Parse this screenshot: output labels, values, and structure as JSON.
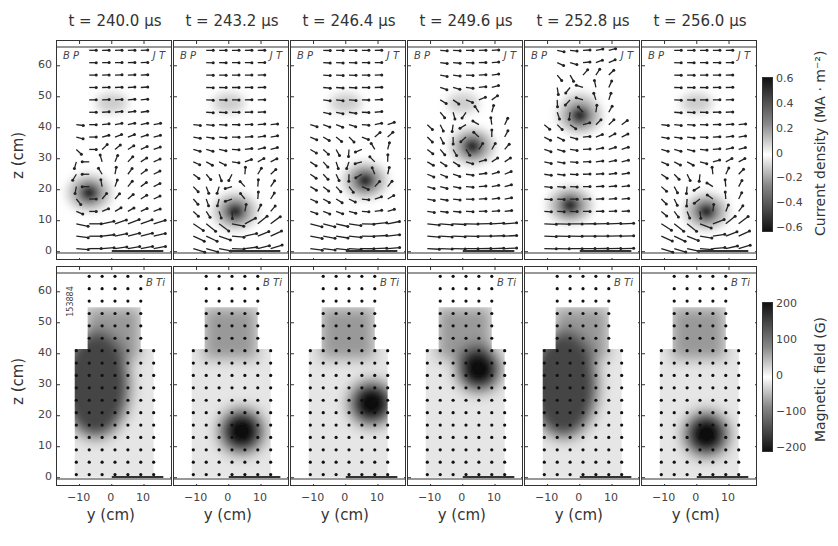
{
  "figure": {
    "shot_id": "153884",
    "times": [
      "t = 240.0 μs",
      "t = 243.2 μs",
      "t = 246.4 μs",
      "t = 249.6 μs",
      "t = 252.8 μs",
      "t = 256.0 μs"
    ],
    "top_row": {
      "left_label": "B P",
      "right_label": "J T",
      "ylabel": "z (cm)"
    },
    "bottom_row": {
      "right_label": "B Ti",
      "ylabel": "z (cm)",
      "xlabel": "y (cm)"
    },
    "yticks": [
      "60",
      "50",
      "40",
      "30",
      "20",
      "10",
      "0"
    ],
    "xticks": [
      "−10",
      "0",
      "10"
    ],
    "colorbar_top": {
      "label": "Current density (MA · m⁻²)",
      "ticks": [
        "0.6",
        "0.4",
        "0.2",
        "0",
        "−0.2",
        "−0.4",
        "−0.6"
      ]
    },
    "colorbar_bottom": {
      "label": "Magnetic field (G)",
      "ticks": [
        "200",
        "100",
        "0",
        "−100",
        "−200"
      ]
    }
  },
  "chart_data": [
    {
      "type": "heatmap",
      "title": "Current density J_T with poloidal field vectors B_P",
      "subplots": [
        "t = 240.0 μs",
        "t = 243.2 μs",
        "t = 246.4 μs",
        "t = 249.6 μs",
        "t = 252.8 μs",
        "t = 256.0 μs"
      ],
      "xlabel": "y (cm)",
      "ylabel": "z (cm)",
      "xlim": [
        -17,
        19
      ],
      "ylim": [
        -1,
        68
      ],
      "xticks": [
        -10,
        0,
        10
      ],
      "yticks": [
        0,
        10,
        20,
        30,
        40,
        50,
        60
      ],
      "colorbar": {
        "label": "Current density (MA · m⁻²)",
        "range": [
          -0.6,
          0.6
        ]
      },
      "features": [
        {
          "t_us": 240.0,
          "dark_spot": {
            "y": -7,
            "z": 19
          }
        },
        {
          "t_us": 243.2,
          "dark_spot": {
            "y": 2,
            "z": 13
          }
        },
        {
          "t_us": 246.4,
          "dark_spot": {
            "y": 6,
            "z": 23
          }
        },
        {
          "t_us": 249.6,
          "dark_spot": {
            "y": 3,
            "z": 34
          }
        },
        {
          "t_us": 252.8,
          "dark_spots": [
            {
              "y": 0,
              "z": 44
            },
            {
              "y": -3,
              "z": 15
            }
          ]
        },
        {
          "t_us": 256.0,
          "dark_spot": {
            "y": 3,
            "z": 13
          }
        }
      ]
    },
    {
      "type": "heatmap",
      "title": "Toroidal magnetic field B_Ti",
      "subplots": [
        "t = 240.0 μs",
        "t = 243.2 μs",
        "t = 246.4 μs",
        "t = 249.6 μs",
        "t = 252.8 μs",
        "t = 256.0 μs"
      ],
      "xlabel": "y (cm)",
      "ylabel": "z (cm)",
      "xlim": [
        -17,
        19
      ],
      "ylim": [
        -1,
        68
      ],
      "xticks": [
        -10,
        0,
        10
      ],
      "yticks": [
        0,
        10,
        20,
        30,
        40,
        50,
        60
      ],
      "colorbar": {
        "label": "Magnetic field (G)",
        "range": [
          -250,
          250
        ],
        "ticks": [
          -200,
          -100,
          0,
          100,
          200
        ]
      },
      "features": [
        {
          "t_us": 240.0,
          "dark_region": {
            "y": -5,
            "z": 30
          }
        },
        {
          "t_us": 243.2,
          "dark_spot": {
            "y": 4,
            "z": 15
          }
        },
        {
          "t_us": 246.4,
          "dark_spot": {
            "y": 8,
            "z": 24
          }
        },
        {
          "t_us": 249.6,
          "dark_spot": {
            "y": 5,
            "z": 35
          }
        },
        {
          "t_us": 252.8,
          "dark_region": {
            "y": -5,
            "z": 30
          }
        },
        {
          "t_us": 256.0,
          "dark_spot": {
            "y": 3,
            "z": 14
          }
        }
      ]
    }
  ]
}
